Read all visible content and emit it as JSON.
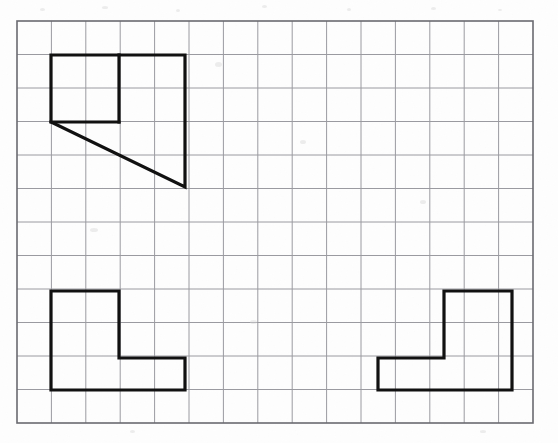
{
  "worksheet": {
    "title": "Grid paper geometry worksheet",
    "description": "Three bold outlined shapes drawn on light blue-grey square grid paper",
    "background_color": "#fdfdfd",
    "paper_tint": "#fcfcfd"
  },
  "grid": {
    "origin_x": 17,
    "origin_y": 21,
    "columns": 15,
    "rows": 12,
    "cell_width": 34.4,
    "cell_height": 33.5,
    "width": 516,
    "height": 402,
    "line_color": "#9a9aa0",
    "line_width": 1,
    "border_color": "#6a6a70",
    "border_width": 1.6,
    "visible": true
  },
  "shapes": [
    {
      "id": "shape-top-left",
      "name": "square-with-right-triangle",
      "label": "Top left composite figure",
      "stroke_color": "#111111",
      "stroke_width": 3.2,
      "fill": "none",
      "points_px": [
        [
          51,
          55
        ],
        [
          185,
          55
        ],
        [
          185,
          187
        ],
        [
          51,
          122
        ],
        [
          51,
          55
        ]
      ],
      "extra_segments_px": [
        [
          [
            51,
            122
          ],
          [
            119,
            122
          ]
        ],
        [
          [
            119,
            55
          ],
          [
            119,
            122
          ]
        ]
      ],
      "grid_cells": {
        "square": "columns 1-3, rows 1-3",
        "triangle": "diagonal from (1,3) to (5,5)"
      }
    },
    {
      "id": "shape-bottom-left",
      "name": "left-facing-L-shape",
      "label": "Bottom left L figure",
      "stroke_color": "#111111",
      "stroke_width": 3.2,
      "fill": "none",
      "points_px": [
        [
          51,
          291
        ],
        [
          119,
          291
        ],
        [
          119,
          358
        ],
        [
          185,
          358
        ],
        [
          185,
          390
        ],
        [
          51,
          390
        ],
        [
          51,
          291
        ]
      ],
      "grid_cells": {
        "upright": "columns 1-3, rows 8-10",
        "foot": "columns 1-5, rows 10-11"
      }
    },
    {
      "id": "shape-bottom-right",
      "name": "right-facing-L-shape",
      "label": "Bottom right mirrored L figure",
      "stroke_color": "#111111",
      "stroke_width": 3.2,
      "fill": "none",
      "points_px": [
        [
          444,
          291
        ],
        [
          512,
          291
        ],
        [
          512,
          390
        ],
        [
          378,
          390
        ],
        [
          378,
          358
        ],
        [
          444,
          358
        ],
        [
          444,
          291
        ]
      ],
      "grid_cells": {
        "upright": "columns 12-14, rows 8-10",
        "foot": "columns 10-14, rows 10-11"
      }
    }
  ],
  "specks": [
    {
      "x": 40,
      "y": 8,
      "w": 5,
      "h": 3
    },
    {
      "x": 102,
      "y": 6,
      "w": 6,
      "h": 3
    },
    {
      "x": 176,
      "y": 9,
      "w": 4,
      "h": 3
    },
    {
      "x": 262,
      "y": 5,
      "w": 5,
      "h": 3
    },
    {
      "x": 347,
      "y": 8,
      "w": 4,
      "h": 3
    },
    {
      "x": 431,
      "y": 7,
      "w": 5,
      "h": 3
    },
    {
      "x": 498,
      "y": 9,
      "w": 4,
      "h": 2
    },
    {
      "x": 215,
      "y": 62,
      "w": 7,
      "h": 5
    },
    {
      "x": 300,
      "y": 140,
      "w": 6,
      "h": 4
    },
    {
      "x": 90,
      "y": 228,
      "w": 8,
      "h": 4
    },
    {
      "x": 420,
      "y": 200,
      "w": 6,
      "h": 4
    },
    {
      "x": 250,
      "y": 320,
      "w": 7,
      "h": 4
    },
    {
      "x": 480,
      "y": 430,
      "w": 6,
      "h": 3
    },
    {
      "x": 130,
      "y": 430,
      "w": 5,
      "h": 3
    }
  ]
}
